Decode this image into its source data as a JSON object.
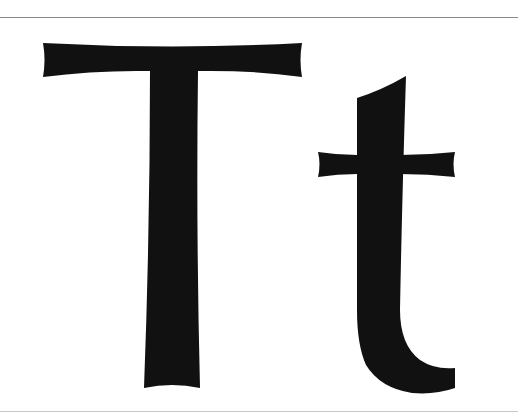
{
  "specimen": {
    "text": "Tt",
    "uppercase": "T",
    "lowercase": "t",
    "glyph_color": "#111111",
    "background_color": "#ffffff",
    "rule_top_color": "#8a8a8a",
    "rule_bottom_color": "#c8c8c8"
  }
}
